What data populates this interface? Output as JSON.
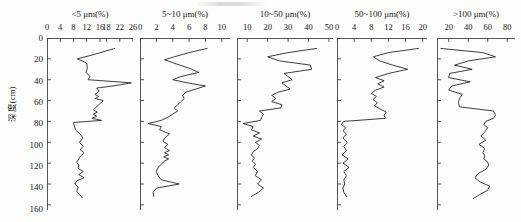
{
  "figure": {
    "y_axis_label": "深度(cm)",
    "y_ticks": [
      0,
      20,
      40,
      60,
      80,
      100,
      120,
      140,
      160
    ],
    "y_range": [
      0,
      165
    ],
    "line_color": "#1b1b1b",
    "background_color": "#fdfdfc"
  },
  "chart_data": {
    "type": "line",
    "title": "",
    "ylabel": "深度(cm)",
    "ylim": [
      0,
      165
    ],
    "y_inverted": true,
    "grid": false,
    "legend": "none",
    "orientation": "depth-profile",
    "panels": [
      {
        "title": "<5 μm(%)",
        "xlabel": "<5 μm(%)",
        "xticks": [
          0,
          4,
          8,
          12,
          16,
          18,
          22,
          26
        ],
        "xlim": [
          0,
          26
        ],
        "depths": [
          10,
          16,
          20,
          24,
          29,
          33,
          37,
          40,
          43,
          46,
          48,
          51,
          54,
          56,
          58,
          60,
          63,
          66,
          69,
          71,
          73,
          75,
          77,
          79,
          81,
          84,
          88,
          92,
          96,
          100,
          104,
          107,
          110,
          113,
          116,
          119,
          122,
          125,
          128,
          131,
          134,
          137,
          140,
          143,
          147,
          150,
          153
        ],
        "values": [
          20.5,
          14.0,
          9.2,
          12.0,
          12.2,
          11.8,
          13.0,
          12.4,
          25.5,
          20.0,
          15.0,
          15.8,
          14.5,
          15.6,
          14.6,
          17.0,
          16.0,
          15.0,
          14.0,
          15.2,
          14.0,
          15.0,
          13.6,
          16.5,
          8.0,
          8.2,
          8.6,
          10.0,
          10.8,
          9.8,
          11.0,
          10.0,
          11.2,
          10.2,
          9.6,
          9.0,
          9.6,
          9.4,
          11.0,
          9.6,
          11.2,
          9.0,
          8.4,
          9.4,
          9.0,
          9.8,
          10.6
        ]
      },
      {
        "title": "5~10 μm(%)",
        "xlabel": "5~10 μm(%)",
        "xticks": [
          0,
          2,
          4,
          6,
          8,
          10
        ],
        "xlim": [
          0,
          11
        ],
        "depths": [
          10,
          14,
          18,
          21,
          25,
          29,
          33,
          37,
          40,
          43,
          46,
          49,
          52,
          55,
          58,
          61,
          64,
          67,
          70,
          73,
          76,
          79,
          82,
          85,
          88,
          92,
          96,
          99,
          102,
          105,
          108,
          110,
          112,
          114,
          116,
          118,
          121,
          124,
          128,
          132,
          136,
          140,
          144,
          148,
          152
        ],
        "values": [
          8.2,
          6.0,
          4.2,
          3.0,
          4.5,
          6.0,
          7.2,
          5.0,
          4.0,
          5.8,
          8.0,
          6.8,
          5.6,
          5.2,
          5.4,
          5.0,
          4.6,
          4.2,
          4.6,
          4.0,
          3.4,
          2.6,
          1.0,
          2.6,
          2.4,
          3.6,
          3.0,
          2.8,
          3.4,
          3.0,
          3.6,
          3.0,
          3.5,
          2.9,
          3.5,
          3.0,
          2.6,
          2.2,
          2.0,
          2.2,
          2.6,
          4.8,
          2.0,
          1.6,
          1.7
        ]
      },
      {
        "title": "10~50 μm(%)",
        "xlabel": "10~50 μm(%)",
        "xticks": [
          10,
          20,
          30,
          40,
          50
        ],
        "xlim": [
          5,
          52
        ],
        "depths": [
          10,
          14,
          18,
          22,
          26,
          30,
          34,
          37,
          40,
          43,
          46,
          49,
          52,
          55,
          58,
          61,
          64,
          67,
          70,
          73,
          76,
          79,
          82,
          85,
          88,
          91,
          94,
          97,
          100,
          103,
          106,
          109,
          112,
          115,
          118,
          121,
          124,
          128,
          132,
          136,
          140,
          144,
          148,
          152
        ],
        "values": [
          44.0,
          30.0,
          20.0,
          26.0,
          41.0,
          41.5,
          28.0,
          30.0,
          32.0,
          27.0,
          29.0,
          31.0,
          25.0,
          22.0,
          24.0,
          22.0,
          27.0,
          26.5,
          16.0,
          18.0,
          17.0,
          16.5,
          8.0,
          13.0,
          12.0,
          16.0,
          13.0,
          17.0,
          14.0,
          16.0,
          15.0,
          13.0,
          12.0,
          13.5,
          12.5,
          14.0,
          13.0,
          15.0,
          14.0,
          17.0,
          15.0,
          18.0,
          15.5,
          12.0
        ]
      },
      {
        "title": "50~100 μm(%)",
        "xlabel": "50~100 μm(%)",
        "xticks": [
          0,
          4,
          8,
          12,
          16,
          20
        ],
        "xlim": [
          0,
          21
        ],
        "depths": [
          10,
          14,
          18,
          22,
          26,
          30,
          34,
          38,
          41,
          44,
          47,
          50,
          53,
          56,
          59,
          62,
          65,
          68,
          71,
          74,
          77,
          80,
          83,
          86,
          89,
          92,
          96,
          100,
          104,
          108,
          112,
          116,
          120,
          124,
          128,
          132,
          136,
          140,
          144,
          148,
          152
        ],
        "values": [
          19.0,
          12.0,
          8.5,
          10.0,
          13.0,
          16.5,
          12.0,
          9.0,
          11.0,
          9.5,
          11.0,
          9.0,
          8.0,
          9.2,
          8.4,
          9.4,
          8.8,
          10.0,
          11.5,
          11.0,
          11.3,
          1.5,
          1.0,
          2.0,
          1.4,
          2.2,
          1.4,
          2.4,
          1.6,
          2.2,
          1.2,
          2.6,
          1.4,
          2.8,
          1.6,
          2.2,
          1.6,
          1.8,
          1.4,
          1.6,
          2.2
        ]
      },
      {
        "title": ">100 μm(%)",
        "xlabel": ">100 μm(%)",
        "xticks": [
          20,
          40,
          60,
          80
        ],
        "xlim": [
          8,
          88
        ],
        "depths": [
          10,
          14,
          18,
          22,
          26,
          30,
          34,
          38,
          42,
          46,
          50,
          54,
          58,
          62,
          66,
          70,
          74,
          77,
          80,
          83,
          86,
          90,
          94,
          98,
          102,
          106,
          110,
          113,
          116,
          119,
          122,
          126,
          130,
          134,
          138,
          142,
          146,
          150,
          154
        ],
        "values": [
          12.0,
          55.0,
          68.0,
          40.0,
          26.0,
          44.0,
          21.0,
          20.0,
          42.0,
          23.0,
          20.0,
          34.0,
          31.0,
          30.0,
          31.0,
          66.0,
          68.0,
          66.0,
          58.0,
          56.0,
          60.0,
          57.0,
          53.0,
          58.0,
          51.0,
          57.0,
          55.0,
          57.0,
          56.0,
          60.0,
          61.0,
          58.0,
          50.0,
          47.0,
          52.0,
          62.0,
          60.0,
          52.0,
          45.0
        ]
      }
    ]
  }
}
